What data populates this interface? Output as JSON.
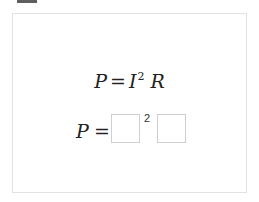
{
  "top_tab": {
    "color": "#5f5f5f"
  },
  "question": {
    "given_formula": {
      "lhs": "P",
      "equals": "=",
      "term1_base": "I",
      "term1_exponent": "2",
      "term2": "R"
    },
    "answer_formula": {
      "lhs": "P",
      "equals": "=",
      "blank1_value": "",
      "blank1_exponent": "2",
      "blank2_value": ""
    }
  },
  "colors": {
    "panel_border": "#e2e2e2",
    "input_border": "#cfcfcf",
    "text": "#222222"
  }
}
